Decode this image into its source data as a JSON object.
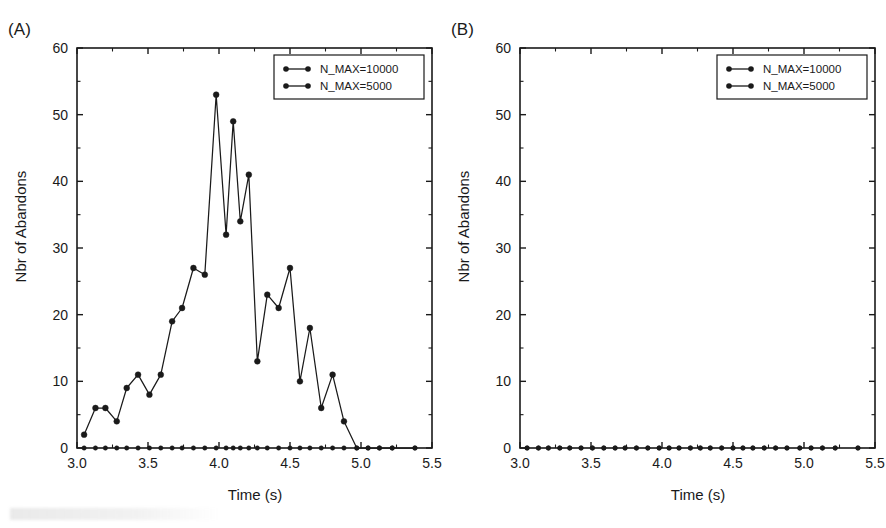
{
  "figure": {
    "panels": [
      {
        "tag": "(A)",
        "xlabel": "Time (s)",
        "ylabel": "Nbr of Abandons"
      },
      {
        "tag": "(B)",
        "xlabel": "Time (s)",
        "ylabel": "Nbr of Abandons"
      }
    ],
    "legend": {
      "entries": [
        {
          "label": "N_MAX=10000",
          "marker": "circle",
          "color": "#1a1a1a"
        },
        {
          "label": "N_MAX=5000",
          "marker": "circle",
          "color": "#1a1a1a"
        }
      ]
    },
    "axis": {
      "xticks": [
        "3.0",
        "3.5",
        "4.0",
        "4.5",
        "5.0",
        "5.5"
      ],
      "yticks": [
        "0",
        "10",
        "20",
        "30",
        "40",
        "50",
        "60"
      ]
    }
  },
  "chart_data": [
    {
      "type": "line",
      "panel": "(A)",
      "title": "",
      "xlabel": "Time (s)",
      "ylabel": "Nbr of Abandons",
      "xlim": [
        3.0,
        5.5
      ],
      "ylim": [
        0,
        60
      ],
      "xticks": [
        3.0,
        3.5,
        4.0,
        4.5,
        5.0,
        5.5
      ],
      "yticks": [
        0,
        10,
        20,
        30,
        40,
        50,
        60
      ],
      "grid": false,
      "legend_position": "top-right",
      "x": [
        3.05,
        3.13,
        3.2,
        3.28,
        3.35,
        3.43,
        3.51,
        3.59,
        3.67,
        3.74,
        3.82,
        3.9,
        3.98,
        4.05,
        4.1,
        4.15,
        4.21,
        4.27,
        4.34,
        4.42,
        4.5,
        4.57,
        4.64,
        4.72,
        4.8,
        4.88,
        4.97,
        5.05,
        5.13,
        5.22,
        5.38
      ],
      "series": [
        {
          "name": "N_MAX=10000",
          "marker": "circle",
          "color": "#1a1a1a",
          "values": [
            2,
            6,
            6,
            4,
            9,
            11,
            8,
            11,
            19,
            21,
            27,
            26,
            53,
            32,
            49,
            34,
            41,
            13,
            23,
            21,
            27,
            10,
            18,
            6,
            11,
            4,
            0,
            0,
            0,
            0,
            0
          ]
        },
        {
          "name": "N_MAX=5000",
          "marker": "circle",
          "color": "#1a1a1a",
          "values": [
            0,
            0,
            0,
            0,
            0,
            0,
            0,
            0,
            0,
            0,
            0,
            0,
            0,
            0,
            0,
            0,
            0,
            0,
            0,
            0,
            0,
            0,
            0,
            0,
            0,
            0,
            0,
            0,
            0,
            0,
            0
          ]
        }
      ]
    },
    {
      "type": "line",
      "panel": "(B)",
      "title": "",
      "xlabel": "Time (s)",
      "ylabel": "Nbr of Abandons",
      "xlim": [
        3.0,
        5.5
      ],
      "ylim": [
        0,
        60
      ],
      "xticks": [
        3.0,
        3.5,
        4.0,
        4.5,
        5.0,
        5.5
      ],
      "yticks": [
        0,
        10,
        20,
        30,
        40,
        50,
        60
      ],
      "grid": false,
      "legend_position": "top-right",
      "x": [
        3.05,
        3.13,
        3.2,
        3.28,
        3.35,
        3.43,
        3.51,
        3.59,
        3.67,
        3.74,
        3.82,
        3.9,
        3.98,
        4.05,
        4.12,
        4.2,
        4.27,
        4.34,
        4.42,
        4.5,
        4.57,
        4.64,
        4.72,
        4.8,
        4.88,
        4.97,
        5.05,
        5.13,
        5.22,
        5.38
      ],
      "series": [
        {
          "name": "N_MAX=10000",
          "marker": "circle",
          "color": "#1a1a1a",
          "values": [
            0,
            0,
            0,
            0,
            0,
            0,
            0,
            0,
            0,
            0,
            0,
            0,
            0,
            0,
            0,
            0,
            0,
            0,
            0,
            0,
            0,
            0,
            0,
            0,
            0,
            0,
            0,
            0,
            0,
            0
          ]
        },
        {
          "name": "N_MAX=5000",
          "marker": "circle",
          "color": "#1a1a1a",
          "values": [
            0,
            0,
            0,
            0,
            0,
            0,
            0,
            0,
            0,
            0,
            0,
            0,
            0,
            0,
            0,
            0,
            0,
            0,
            0,
            0,
            0,
            0,
            0,
            0,
            0,
            0,
            0,
            0,
            0,
            0
          ]
        }
      ]
    }
  ]
}
